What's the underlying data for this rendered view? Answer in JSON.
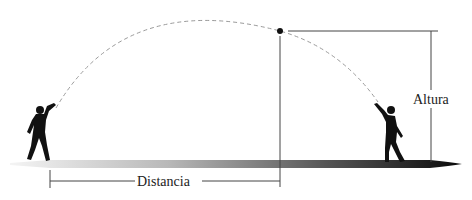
{
  "diagram": {
    "labels": {
      "height": "Altura",
      "distance": "Distancia"
    },
    "elements": {
      "trajectory": "dashed parabolic arc",
      "apex_marker": "ball at maximum height",
      "thrower_left": "silhouette of child throwing",
      "catcher_right": "silhouette of child catching",
      "ground": "gradient shadow ground bar"
    },
    "colors": {
      "silhouette": "#111111",
      "trajectory": "#9a9a9a",
      "lines": "#444444",
      "ground_start": "#f2f2f2",
      "ground_end": "#111111"
    }
  }
}
